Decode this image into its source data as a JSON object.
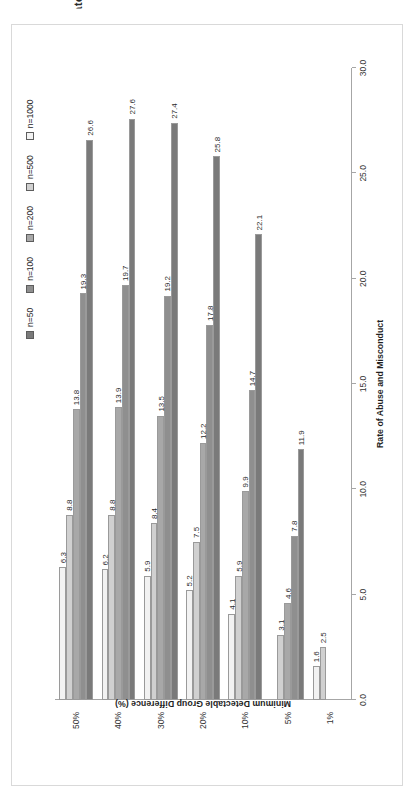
{
  "figure": {
    "clipped_title": "Minimum Detectable Group Difference by Rate of Abuse and Misconduct",
    "background": "#ffffff",
    "frame_color": "#d9d9d9"
  },
  "legend": {
    "position": "top-right",
    "items": [
      {
        "label": "n=50",
        "color": "#7a7a7a"
      },
      {
        "label": "n=100",
        "color": "#8f8f8f"
      },
      {
        "label": "n=200",
        "color": "#a8a8a8"
      },
      {
        "label": "n=500",
        "color": "#d0d0d0"
      },
      {
        "label": "n=1000",
        "color": "#f2f2f2"
      }
    ]
  },
  "chart_data": {
    "type": "bar",
    "orientation": "horizontal",
    "title": "",
    "xlabel": "Rate of Abuse and Misconduct",
    "ylabel": "Minimum Detectable Group Difference (%)",
    "categories": [
      "50%",
      "40%",
      "30%",
      "20%",
      "10%",
      "5%",
      "1%"
    ],
    "value_axis_ticks": [
      "0.0",
      "5.0",
      "10.0",
      "15.0",
      "20.0",
      "25.0",
      "30.0"
    ],
    "ylim": [
      0,
      30
    ],
    "grid": false,
    "legend_position": "top-right",
    "series": [
      {
        "name": "n=50",
        "color": "#7a7a7a",
        "values": [
          26.6,
          27.6,
          27.4,
          25.8,
          22.1,
          11.9,
          null
        ]
      },
      {
        "name": "n=100",
        "color": "#8f8f8f",
        "values": [
          19.3,
          19.7,
          19.2,
          17.8,
          14.7,
          7.8,
          null
        ]
      },
      {
        "name": "n=200",
        "color": "#a8a8a8",
        "values": [
          13.8,
          13.9,
          13.5,
          12.2,
          9.9,
          4.6,
          null
        ]
      },
      {
        "name": "n=500",
        "color": "#d0d0d0",
        "values": [
          8.8,
          8.8,
          8.4,
          7.5,
          5.9,
          3.1,
          2.5
        ]
      },
      {
        "name": "n=1000",
        "color": "#f2f2f2",
        "values": [
          6.3,
          6.2,
          5.9,
          5.2,
          4.1,
          null,
          1.6
        ]
      }
    ],
    "data_labels": {
      "50%": [
        "26.6",
        "19.3",
        "13.8",
        "8.8",
        "6.3"
      ],
      "40%": [
        "27.6",
        "19.7",
        "13.9",
        "8.8",
        "6.2"
      ],
      "30%": [
        "27.4",
        "19.2",
        "13.5",
        "8.4",
        "5.9"
      ],
      "20%": [
        "25.8",
        "17.8",
        "12.2",
        "7.5",
        "5.2"
      ],
      "10%": [
        "22.1",
        "14.7",
        "9.9",
        "5.9",
        "4.1"
      ],
      "5%": [
        "11.9",
        "7.8",
        "4.6",
        "3.1"
      ],
      "1%": [
        "2.5",
        "1.6"
      ]
    }
  }
}
